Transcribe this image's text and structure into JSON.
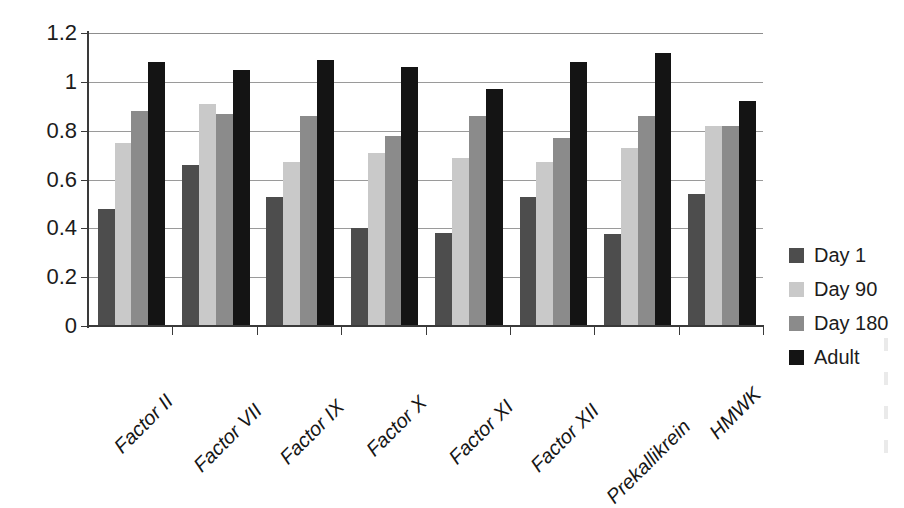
{
  "chart_data": {
    "type": "bar",
    "title": "",
    "subtitle": "",
    "xlabel": "",
    "ylabel": "",
    "ylim": [
      0,
      1.2
    ],
    "ytick_labels": [
      "0",
      "0.2",
      "0.4",
      "0.6",
      "0.8",
      "1",
      "1.2"
    ],
    "ytick_values": [
      0,
      0.2,
      0.4,
      0.6,
      0.8,
      1.0,
      1.2
    ],
    "grid": "horizontal",
    "legend_position": "right",
    "categories": [
      "Factor II",
      "Factor VII",
      "Factor IX",
      "Factor X",
      "Factor XI",
      "Factor XII",
      "Prekallikrein",
      "HMWK"
    ],
    "series": [
      {
        "name": "Day 1",
        "color": "#4d4d4d",
        "values": [
          0.48,
          0.66,
          0.53,
          0.4,
          0.38,
          0.53,
          0.375,
          0.54
        ]
      },
      {
        "name": "Day 90",
        "color": "#c9c9c9",
        "values": [
          0.75,
          0.91,
          0.67,
          0.71,
          0.69,
          0.67,
          0.73,
          0.82
        ]
      },
      {
        "name": "Day 180",
        "color": "#8b8b8b",
        "values": [
          0.88,
          0.87,
          0.86,
          0.78,
          0.86,
          0.77,
          0.86,
          0.82
        ]
      },
      {
        "name": "Adult",
        "color": "#141414",
        "values": [
          1.08,
          1.05,
          1.09,
          1.06,
          0.97,
          1.08,
          1.12,
          0.92
        ]
      }
    ]
  },
  "legend": {
    "entries": [
      {
        "label": "Day 1",
        "color": "#4d4d4d"
      },
      {
        "label": "Day 90",
        "color": "#c9c9c9"
      },
      {
        "label": "Day 180",
        "color": "#8b8b8b"
      },
      {
        "label": "Adult",
        "color": "#141414"
      }
    ]
  }
}
